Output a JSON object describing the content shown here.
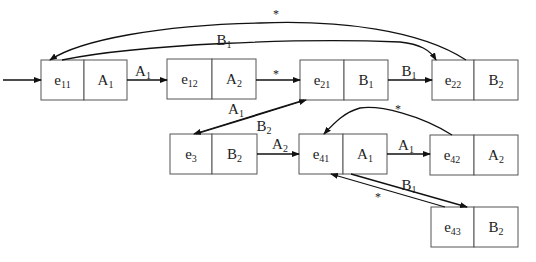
{
  "diagram": {
    "nodes": [
      {
        "id": "e11",
        "state": {
          "base": "e",
          "sub": "11"
        },
        "action": {
          "base": "A",
          "sub": "1"
        }
      },
      {
        "id": "e12",
        "state": {
          "base": "e",
          "sub": "12"
        },
        "action": {
          "base": "A",
          "sub": "2"
        }
      },
      {
        "id": "e21",
        "state": {
          "base": "e",
          "sub": "21"
        },
        "action": {
          "base": "B",
          "sub": "1"
        }
      },
      {
        "id": "e22",
        "state": {
          "base": "e",
          "sub": "22"
        },
        "action": {
          "base": "B",
          "sub": "2"
        }
      },
      {
        "id": "e3",
        "state": {
          "base": "e",
          "sub": "3"
        },
        "action": {
          "base": "B",
          "sub": "2"
        }
      },
      {
        "id": "e41",
        "state": {
          "base": "e",
          "sub": "41"
        },
        "action": {
          "base": "A",
          "sub": "1"
        }
      },
      {
        "id": "e42",
        "state": {
          "base": "e",
          "sub": "42"
        },
        "action": {
          "base": "A",
          "sub": "2"
        }
      },
      {
        "id": "e43",
        "state": {
          "base": "e",
          "sub": "43"
        },
        "action": {
          "base": "B",
          "sub": "2"
        }
      }
    ],
    "edges": [
      {
        "from": "start",
        "to": "e11",
        "label": null
      },
      {
        "from": "e11",
        "to": "e12",
        "label": {
          "base": "A",
          "sub": "1"
        }
      },
      {
        "from": "e12",
        "to": "e21",
        "label": {
          "base": "*",
          "sub": ""
        }
      },
      {
        "from": "e21",
        "to": "e22",
        "label": {
          "base": "B",
          "sub": "1"
        }
      },
      {
        "from": "e11",
        "to": "e22",
        "label": {
          "base": "B",
          "sub": "1"
        }
      },
      {
        "from": "e22",
        "to": "e11",
        "label": {
          "base": "*",
          "sub": ""
        }
      },
      {
        "from": "e21",
        "to": "e3",
        "label": {
          "base": "A",
          "sub": "1"
        }
      },
      {
        "from": "e3",
        "to": "e21",
        "label": {
          "base": "B",
          "sub": "2"
        }
      },
      {
        "from": "e3",
        "to": "e41",
        "label": {
          "base": "A",
          "sub": "2"
        }
      },
      {
        "from": "e41",
        "to": "e42",
        "label": {
          "base": "A",
          "sub": "1"
        }
      },
      {
        "from": "e42",
        "to": "e41",
        "label": {
          "base": "*",
          "sub": ""
        }
      },
      {
        "from": "e41",
        "to": "e43",
        "label": {
          "base": "B",
          "sub": "1"
        }
      },
      {
        "from": "e43",
        "to": "e41",
        "label": {
          "base": "*",
          "sub": ""
        }
      }
    ]
  }
}
